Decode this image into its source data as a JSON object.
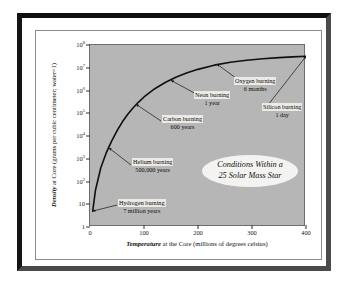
{
  "chart_data": {
    "type": "line",
    "title": "Conditions Within a 25 Solar Mass Star",
    "title_line1": "Conditions Within a",
    "title_line2": "25 Solar Mass Star",
    "xlabel_emph": "Temperature",
    "xlabel_rest": " at the Core (millions of degrees celsius)",
    "ylabel_emph": "Density",
    "ylabel_rest": " at Core (grams per cubic centimeter; water=1)",
    "xscale": "linear",
    "yscale": "log",
    "xlim": [
      0,
      400
    ],
    "ylim": [
      1,
      100000000
    ],
    "grid": false,
    "legend": false,
    "xticks": [
      "0",
      "100",
      "200",
      "300",
      "400"
    ],
    "xtick_values": [
      0,
      100,
      200,
      300,
      400
    ],
    "ytick_values": [
      1,
      10,
      100,
      1000,
      10000,
      100000,
      1000000,
      10000000,
      100000000
    ],
    "yticks": [
      {
        "mantissa": "1",
        "exp": ""
      },
      {
        "mantissa": "10",
        "exp": ""
      },
      {
        "mantissa": "10",
        "exp": "2"
      },
      {
        "mantissa": "10",
        "exp": "3"
      },
      {
        "mantissa": "10",
        "exp": "4"
      },
      {
        "mantissa": "10",
        "exp": "5"
      },
      {
        "mantissa": "10",
        "exp": "6"
      },
      {
        "mantissa": "10",
        "exp": "7"
      },
      {
        "mantissa": "10",
        "exp": "8"
      }
    ],
    "series": [
      {
        "name": "Core density vs temperature",
        "x": [
          5,
          10,
          20,
          30,
          40,
          50,
          60,
          70,
          80,
          90,
          100,
          120,
          140,
          160,
          180,
          200,
          230,
          260,
          290,
          320,
          350,
          375,
          400
        ],
        "y": [
          5,
          40,
          400,
          1800,
          6000,
          17000,
          42000,
          90000,
          175000,
          310000,
          520000,
          1200000,
          2300000,
          3900000,
          6000000,
          8500000,
          13000000,
          17500000,
          21500000,
          25000000,
          28000000,
          30000000,
          32000000
        ]
      }
    ],
    "annotations": [
      {
        "id": "hydrogen-burning",
        "line1": "Hydrogen burning",
        "line2": "7 million years",
        "point_x": 5,
        "point_y": 5
      },
      {
        "id": "helium-burning",
        "line1": "Helium burning",
        "line2": "500,000 years",
        "point_x": 35,
        "point_y": 3000
      },
      {
        "id": "carbon-burning",
        "line1": "Carbon burning",
        "line2": "600 years",
        "point_x": 85,
        "point_y": 250000
      },
      {
        "id": "neon-burning",
        "line1": "Neon burning",
        "line2": "1 year",
        "point_x": 150,
        "point_y": 2800000
      },
      {
        "id": "oxygen-burning",
        "line1": "Oxygen burning",
        "line2": "6 months",
        "point_x": 235,
        "point_y": 14500000
      },
      {
        "id": "silicon-burning",
        "line1": "Silicon burning",
        "line2": "1 day",
        "point_x": 400,
        "point_y": 32000000
      }
    ]
  }
}
